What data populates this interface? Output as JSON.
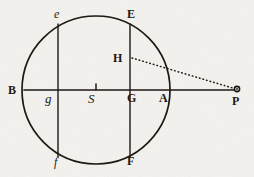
{
  "figure": {
    "background_color": "#f4f2ee",
    "ink_color": "#17140f",
    "circle": {
      "cx": 96,
      "cy": 90,
      "r": 74
    },
    "axis": {
      "label": "diameter B to P",
      "x1": 24,
      "y1": 90,
      "x2": 238,
      "y2": 90
    },
    "chords": [
      {
        "name": "chord-ef",
        "x": 58,
        "y_top": 24,
        "y_bottom": 157
      },
      {
        "name": "chord-EF",
        "x": 130,
        "y_top": 24,
        "y_bottom": 157
      }
    ],
    "center_tick": {
      "x": 96,
      "y_top": 84,
      "y_bottom": 90
    },
    "dotted_line": {
      "name": "line-H-P",
      "x1": 132,
      "y1": 58,
      "x2": 236,
      "y2": 89
    },
    "point_marker": {
      "name": "point-P",
      "cx": 237,
      "cy": 89,
      "r": 3
    },
    "labels": [
      {
        "id": "label-B",
        "text": "B",
        "style": "bold",
        "x": 8,
        "y": 84
      },
      {
        "id": "label-g",
        "text": "g",
        "style": "script",
        "x": 45,
        "y": 92
      },
      {
        "id": "label-S",
        "text": "S",
        "style": "script",
        "x": 88,
        "y": 92
      },
      {
        "id": "label-G",
        "text": "G",
        "style": "bold",
        "x": 127,
        "y": 92
      },
      {
        "id": "label-A",
        "text": "A",
        "style": "bold",
        "x": 159,
        "y": 92
      },
      {
        "id": "label-P",
        "text": "P",
        "style": "bold",
        "x": 232,
        "y": 95
      },
      {
        "id": "label-e",
        "text": "e",
        "style": "ital",
        "x": 54,
        "y": 8
      },
      {
        "id": "label-E",
        "text": "E",
        "style": "bold",
        "x": 127,
        "y": 8
      },
      {
        "id": "label-H",
        "text": "H",
        "style": "bold",
        "x": 113,
        "y": 52
      },
      {
        "id": "label-f",
        "text": "f",
        "style": "ital",
        "x": 54,
        "y": 156
      },
      {
        "id": "label-F",
        "text": "F",
        "style": "bold",
        "x": 127,
        "y": 155
      }
    ]
  }
}
